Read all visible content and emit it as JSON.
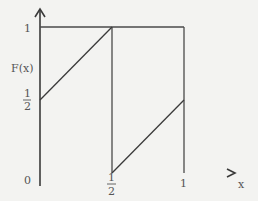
{
  "diagram": {
    "type": "function-plot",
    "function_label": "F(x)",
    "x_axis_label": "x",
    "y_tick_labels": {
      "one": "1",
      "half_num": "1",
      "half_den": "2"
    },
    "x_tick_labels": {
      "zero": "0",
      "half_num": "1",
      "half_den": "2",
      "one": "1"
    },
    "segments": [
      {
        "name": "first-ramp",
        "from": [
          0,
          0.5
        ],
        "to": [
          0.5,
          1
        ]
      },
      {
        "name": "second-ramp",
        "from": [
          0.5,
          0
        ],
        "to": [
          1,
          0.5
        ]
      }
    ],
    "reference_lines": [
      {
        "name": "top-line",
        "y": 1,
        "x_range": [
          0,
          1
        ]
      },
      {
        "name": "vertical-at-half",
        "x": 0.5,
        "y_range": [
          0,
          1
        ]
      },
      {
        "name": "vertical-at-one",
        "x": 1,
        "y_range": [
          0,
          1
        ]
      }
    ],
    "colors": {
      "background": "#f3f3f1",
      "line": "#3a3a3a",
      "text": "#555555"
    }
  }
}
